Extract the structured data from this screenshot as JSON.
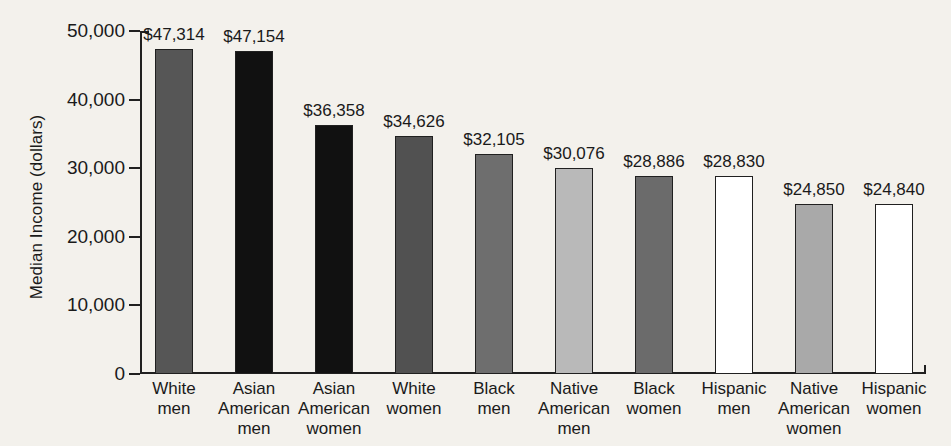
{
  "chart_data": {
    "type": "bar",
    "title": "",
    "xlabel": "",
    "ylabel": "Median Income (dollars)",
    "ylim": [
      0,
      50000
    ],
    "yticks": [
      0,
      10000,
      20000,
      30000,
      40000,
      50000
    ],
    "ytick_labels": [
      "0",
      "10,000",
      "20,000",
      "30,000",
      "40,000",
      "50,000"
    ],
    "grid": false,
    "legend": "none",
    "categories": [
      "White\nmen",
      "Asian\nAmerican\nmen",
      "Asian\nAmerican\nwomen",
      "White\nwomen",
      "Black\nmen",
      "Native\nAmerican\nmen",
      "Black\nwomen",
      "Hispanic\nmen",
      "Native\nAmerican\nwomen",
      "Hispanic\nwomen"
    ],
    "values": [
      47314,
      47154,
      36358,
      34626,
      32105,
      30076,
      28886,
      28830,
      24850,
      24840
    ],
    "value_labels": [
      "$47,314",
      "$47,154",
      "$36,358",
      "$34,626",
      "$32,105",
      "$30,076",
      "$28,886",
      "$28,830",
      "$24,850",
      "$24,840"
    ],
    "bar_colors": [
      "#565656",
      "#111111",
      "#111111",
      "#515151",
      "#6e6e6e",
      "#b9b9b9",
      "#6b6b6b",
      "#ffffff",
      "#a9a9a9",
      "#ffffff"
    ],
    "bar_border_color": "#202020",
    "axis_color": "#202020",
    "background_color": "#f3f1ec"
  }
}
